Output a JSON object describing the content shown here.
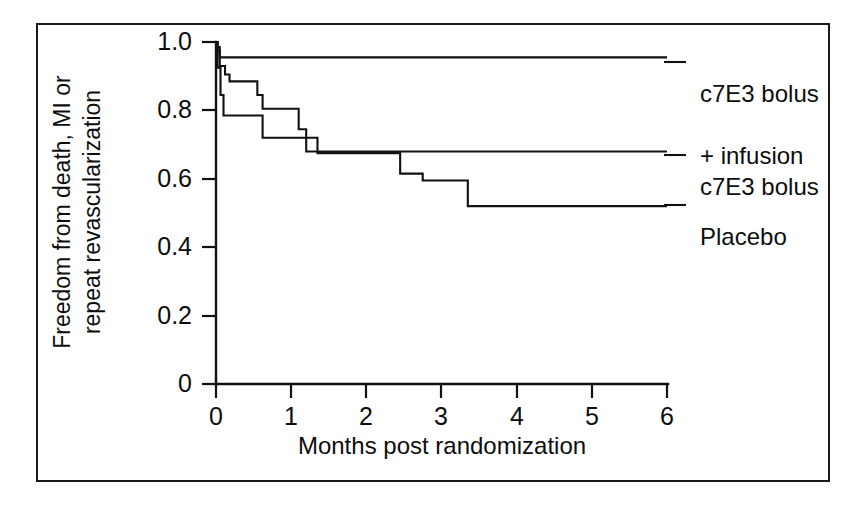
{
  "figure": {
    "background_color": "#ffffff",
    "ink_color": "#111111",
    "frame": true
  },
  "chart_data": {
    "type": "line",
    "subtype": "kaplan-meier-step",
    "title": "",
    "xlabel": "Months post randomization",
    "ylabel": "Freedom from death, MI or\nrepeat revascularization",
    "ylabel_line1": "Freedom from death, MI or",
    "ylabel_line2": "repeat revascularization",
    "xlim": [
      0,
      6
    ],
    "ylim": [
      0,
      1.0
    ],
    "grid": false,
    "legend_position": "right-inline",
    "xticks": [
      0,
      1,
      2,
      3,
      4,
      5,
      6
    ],
    "xtick_labels": [
      "0",
      "1",
      "2",
      "3",
      "4",
      "5",
      "6"
    ],
    "yticks": [
      0,
      0.2,
      0.4,
      0.6,
      0.8,
      1.0
    ],
    "ytick_labels": [
      "0",
      "0.2",
      "0.4",
      "0.6",
      "0.8",
      "1.0"
    ],
    "series": [
      {
        "name": "c7E3 bolus + infusion",
        "label_line1": "c7E3 bolus",
        "label_line2": "+ infusion",
        "end_value": 0.955,
        "x": [
          0,
          0.02,
          0.05,
          6
        ],
        "y": [
          1.0,
          0.985,
          0.955,
          0.955
        ]
      },
      {
        "name": "c7E3 bolus",
        "label_line1": "c7E3 bolus",
        "label_line2": "",
        "end_value": 0.68,
        "x": [
          0,
          0.02,
          0.05,
          0.12,
          0.18,
          0.35,
          0.55,
          0.62,
          0.95,
          1.1,
          1.2,
          6
        ],
        "y": [
          1.0,
          0.975,
          0.93,
          0.905,
          0.885,
          0.885,
          0.845,
          0.805,
          0.805,
          0.745,
          0.68,
          0.68
        ]
      },
      {
        "name": "Placebo",
        "label_line1": "Placebo",
        "label_line2": "",
        "end_value": 0.52,
        "x": [
          0,
          0.02,
          0.06,
          0.1,
          0.5,
          0.62,
          1.15,
          1.35,
          2.25,
          2.45,
          2.75,
          3.35,
          6
        ],
        "y": [
          1.0,
          0.925,
          0.845,
          0.785,
          0.785,
          0.72,
          0.72,
          0.675,
          0.675,
          0.615,
          0.595,
          0.52,
          0.52
        ]
      }
    ]
  }
}
